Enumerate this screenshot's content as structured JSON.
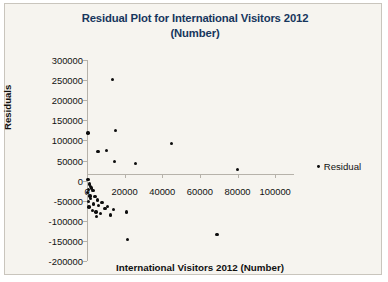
{
  "chart_data": {
    "type": "scatter",
    "title": "Residual Plot for International Visitors 2012 (Number)",
    "title_line1": "Residual Plot for International Visitors 2012",
    "title_line2": "(Number)",
    "xlabel": "International Visitors 2012 (Number)",
    "ylabel": "Residuals",
    "xlim": [
      0,
      110000
    ],
    "ylim": [
      -200000,
      300000
    ],
    "xticks": [
      0,
      20000,
      40000,
      60000,
      80000,
      100000
    ],
    "xtick_labels": [
      "0",
      "20000",
      "40000",
      "60000",
      "80000",
      "100000"
    ],
    "yticks": [
      300000,
      250000,
      200000,
      150000,
      100000,
      50000,
      0,
      -50000,
      -100000,
      -150000,
      -200000
    ],
    "ytick_labels": [
      "300000",
      "250000",
      "200000",
      "150000",
      "100000",
      "50000",
      "0",
      "-50000",
      "-100000",
      "-150000",
      "-200000"
    ],
    "grid": false,
    "legend_position": "right",
    "marker_color": "#0d0d0d",
    "series": [
      {
        "name": "Residual",
        "points": [
          [
            13500,
            252000
          ],
          [
            500,
            118000
          ],
          [
            15000,
            125000
          ],
          [
            5800,
            72000
          ],
          [
            10200,
            75000
          ],
          [
            14500,
            47000
          ],
          [
            25800,
            43000
          ],
          [
            45000,
            93000
          ],
          [
            80000,
            28000
          ],
          [
            600,
            3000
          ],
          [
            1200,
            -8000
          ],
          [
            1800,
            -15000
          ],
          [
            900,
            -22000
          ],
          [
            2400,
            -18000
          ],
          [
            300,
            -30000
          ],
          [
            1500,
            -38000
          ],
          [
            3200,
            -25000
          ],
          [
            2000,
            -45000
          ],
          [
            700,
            -52000
          ],
          [
            4200,
            -40000
          ],
          [
            5500,
            -48000
          ],
          [
            3600,
            -58000
          ],
          [
            6200,
            -62000
          ],
          [
            8000,
            -55000
          ],
          [
            9500,
            -70000
          ],
          [
            11000,
            -64000
          ],
          [
            1100,
            -66000
          ],
          [
            2800,
            -75000
          ],
          [
            4800,
            -78000
          ],
          [
            7200,
            -82000
          ],
          [
            12500,
            -86000
          ],
          [
            14000,
            -72000
          ],
          [
            21000,
            -78000
          ],
          [
            5000,
            -90000
          ],
          [
            21500,
            -146000
          ],
          [
            69000,
            -134000
          ]
        ]
      }
    ]
  },
  "legend": {
    "label": "Residual"
  }
}
